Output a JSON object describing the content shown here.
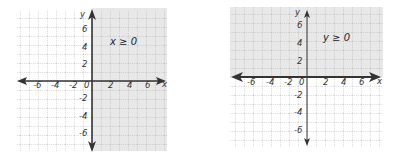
{
  "graphs": [
    {
      "inequality": "x ≥ 0",
      "shaded_region": "x >= 0",
      "x_axis_label": "x",
      "y_axis_label": "y",
      "origin_label": "0",
      "x_tick_labels": [
        "-6",
        "-4",
        "-2",
        "2",
        "4",
        "6"
      ],
      "y_tick_labels": [
        "6",
        "4",
        "2",
        "-2",
        "-4",
        "-6"
      ]
    },
    {
      "inequality": "y ≥ 0",
      "shaded_region": "y >= 0",
      "x_axis_label": "x",
      "y_axis_label": "y",
      "origin_label": "0",
      "x_tick_labels": [
        "-6",
        "-4",
        "-2",
        "2",
        "4",
        "6"
      ],
      "y_tick_labels": [
        "6",
        "4",
        "2",
        "-2",
        "-4",
        "-6"
      ]
    }
  ],
  "colors": {
    "shade": "#e6e6e6",
    "grid": "#9a9a9a",
    "axis": "#333333"
  }
}
